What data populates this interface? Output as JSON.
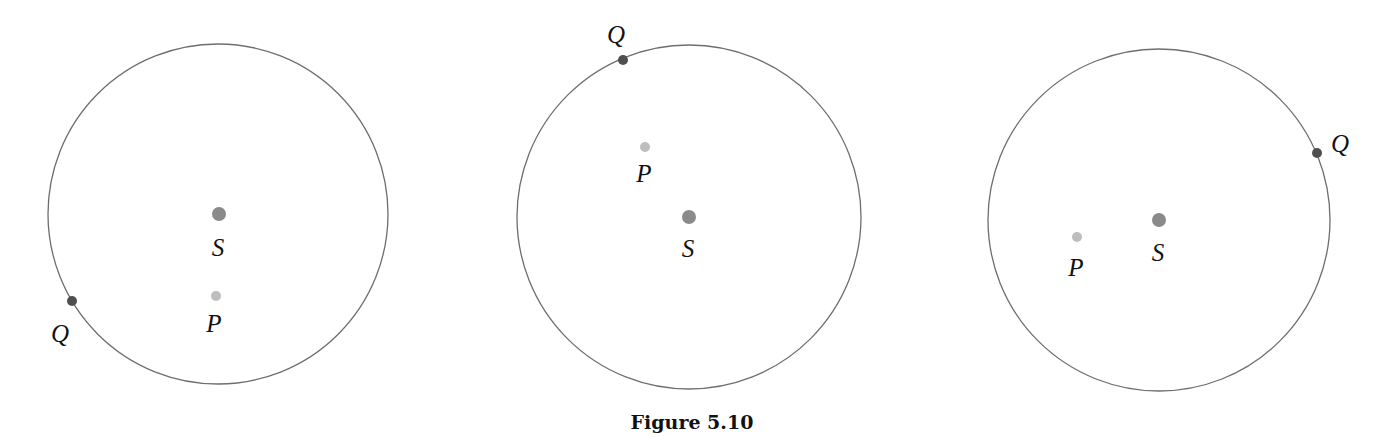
{
  "caption": "Figure 5.10",
  "colors": {
    "circle_stroke": "#6e6e6e",
    "S_fill": "#8a8a8a",
    "P_fill": "#bdbdbd",
    "Q_fill": "#4f4f4f",
    "text": "#111111"
  },
  "panels": [
    {
      "circle": {
        "cx": 218,
        "cy": 214,
        "r": 170
      },
      "S": {
        "label": "S",
        "x": 219,
        "y": 214,
        "r": 7,
        "lx": 218,
        "ly": 256
      },
      "P": {
        "label": "P",
        "x": 216,
        "y": 296,
        "r": 5,
        "lx": 214,
        "ly": 332
      },
      "Q": {
        "label": "Q",
        "x": 72,
        "y": 301,
        "r": 5,
        "lx": 60,
        "ly": 342
      }
    },
    {
      "circle": {
        "cx": 689,
        "cy": 217,
        "r": 172
      },
      "S": {
        "label": "S",
        "x": 689,
        "y": 217,
        "r": 7,
        "lx": 688,
        "ly": 257
      },
      "P": {
        "label": "P",
        "x": 645,
        "y": 147,
        "r": 5,
        "lx": 644,
        "ly": 182
      },
      "Q": {
        "label": "Q",
        "x": 623,
        "y": 60,
        "r": 5,
        "lx": 616,
        "ly": 43
      }
    },
    {
      "circle": {
        "cx": 1159,
        "cy": 220,
        "r": 171
      },
      "S": {
        "label": "S",
        "x": 1159,
        "y": 220,
        "r": 7,
        "lx": 1158,
        "ly": 261
      },
      "P": {
        "label": "P",
        "x": 1077,
        "y": 237,
        "r": 5,
        "lx": 1076,
        "ly": 276
      },
      "Q": {
        "label": "Q",
        "x": 1317,
        "y": 153,
        "r": 5,
        "lx": 1340,
        "ly": 152
      }
    }
  ]
}
